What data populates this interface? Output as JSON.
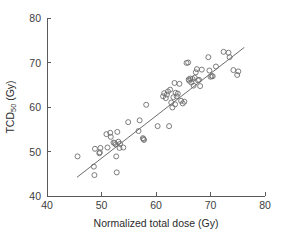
{
  "chart_data": {
    "type": "scatter",
    "title": "",
    "xlabel": "Normalized total dose (Gy)",
    "ylabel": "TCD50 (Gy)",
    "ylabel_base": "TCD",
    "ylabel_sub": "50",
    "ylabel_unit": " (Gy)",
    "xlim": [
      40,
      80
    ],
    "ylim": [
      40,
      80
    ],
    "xticks": [
      40,
      50,
      60,
      70,
      80
    ],
    "yticks": [
      40,
      50,
      60,
      70,
      80
    ],
    "xtick_labels": [
      "40",
      "50",
      "60",
      "70",
      "80"
    ],
    "ytick_labels": [
      "40",
      "50",
      "60",
      "70",
      "80"
    ],
    "grid": false,
    "legend": "none",
    "marker_style": "open-circle",
    "marker_color": "#6e6e6e",
    "line_color": "#5a5a5a",
    "axis_color": "#5a5a5a",
    "background_color": "#ffffff",
    "fit_line": {
      "label": "regression line",
      "x_start": 45.5,
      "y_start": 44.2,
      "x_end": 76.2,
      "y_end": 73.4
    },
    "x": [
      45.6,
      48.6,
      48.7,
      48.8,
      49.6,
      49.7,
      49.8,
      50.9,
      51.1,
      51.6,
      51.7,
      52.2,
      52.4,
      52.6,
      52.7,
      52.8,
      52.9,
      53.1,
      53.3,
      53.4,
      54.0,
      54.9,
      56.8,
      57.0,
      57.6,
      57.7,
      57.8,
      58.2,
      60.3,
      61.3,
      61.5,
      61.8,
      62.0,
      62.2,
      62.4,
      62.6,
      62.8,
      63.0,
      63.2,
      63.4,
      63.5,
      63.6,
      63.8,
      64.0,
      64.3,
      64.6,
      64.9,
      65.2,
      65.6,
      65.9,
      66.0,
      66.1,
      66.3,
      66.5,
      66.7,
      66.9,
      67.1,
      67.3,
      67.5,
      67.7,
      67.9,
      68.1,
      68.4,
      69.6,
      69.8,
      70.0,
      70.2,
      70.4,
      71.0,
      72.4,
      73.3,
      73.5,
      74.2,
      74.9,
      75.1
    ],
    "y": [
      48.9,
      46.6,
      44.7,
      50.6,
      49.6,
      49.8,
      50.8,
      53.9,
      50.9,
      54.2,
      53.3,
      52.0,
      51.9,
      51.6,
      48.9,
      45.3,
      54.4,
      52.2,
      50.8,
      51.7,
      50.9,
      56.6,
      54.6,
      57.0,
      53.0,
      52.8,
      52.6,
      60.5,
      55.7,
      62.4,
      63.1,
      62.0,
      62.8,
      63.5,
      55.7,
      63.9,
      61.0,
      59.9,
      62.2,
      65.4,
      60.6,
      63.2,
      62.4,
      63.0,
      65.2,
      61.4,
      60.8,
      61.2,
      69.9,
      70.0,
      66.2,
      65.9,
      66.4,
      65.5,
      66.3,
      64.8,
      66.6,
      67.8,
      68.5,
      66.0,
      66.1,
      64.7,
      68.4,
      71.2,
      68.2,
      66.8,
      67.0,
      66.9,
      69.1,
      72.4,
      72.2,
      71.2,
      68.3,
      67.2,
      68.0
    ]
  }
}
